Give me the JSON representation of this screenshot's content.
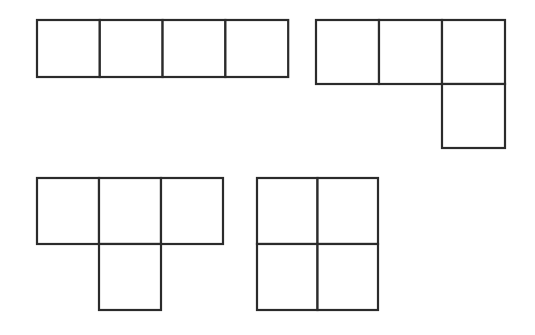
{
  "page": {
    "background_color": "#ffffff",
    "width": 535,
    "height": 335,
    "stroke_color": "#2b2b2b",
    "fill_color": "#ffffff",
    "stroke_width": 2.2
  },
  "figure": {
    "shape_count": 4,
    "cell_width": 62,
    "cell_height": 63,
    "shapes": [
      {
        "id": "shape-1",
        "name": "i-tetromino",
        "label": "I-tetromino",
        "origin_x": 37,
        "origin_y": 20,
        "cols": 4,
        "rows": 1,
        "cell_w": 62.8,
        "cell_h": 57,
        "cells": [
          {
            "col": 0,
            "row": 0
          },
          {
            "col": 1,
            "row": 0
          },
          {
            "col": 2,
            "row": 0
          },
          {
            "col": 3,
            "row": 0
          }
        ]
      },
      {
        "id": "shape-2",
        "name": "l-tetromino",
        "label": "L-tetromino",
        "origin_x": 316,
        "origin_y": 20,
        "cols": 3,
        "rows": 2,
        "cell_w": 63,
        "cell_h": 64,
        "cells": [
          {
            "col": 0,
            "row": 0
          },
          {
            "col": 1,
            "row": 0
          },
          {
            "col": 2,
            "row": 0
          },
          {
            "col": 2,
            "row": 1
          }
        ]
      },
      {
        "id": "shape-3",
        "name": "t-tetromino",
        "label": "T-tetromino",
        "origin_x": 37,
        "origin_y": 178,
        "cols": 3,
        "rows": 2,
        "cell_w": 62,
        "cell_h": 66,
        "cells": [
          {
            "col": 0,
            "row": 0
          },
          {
            "col": 1,
            "row": 0
          },
          {
            "col": 2,
            "row": 0
          },
          {
            "col": 1,
            "row": 1
          }
        ]
      },
      {
        "id": "shape-4",
        "name": "o-tetromino",
        "label": "O-tetromino",
        "origin_x": 257,
        "origin_y": 178,
        "cols": 2,
        "rows": 2,
        "cell_w": 60.5,
        "cell_h": 66,
        "cells": [
          {
            "col": 0,
            "row": 0
          },
          {
            "col": 1,
            "row": 0
          },
          {
            "col": 0,
            "row": 1
          },
          {
            "col": 1,
            "row": 1
          }
        ]
      }
    ]
  }
}
